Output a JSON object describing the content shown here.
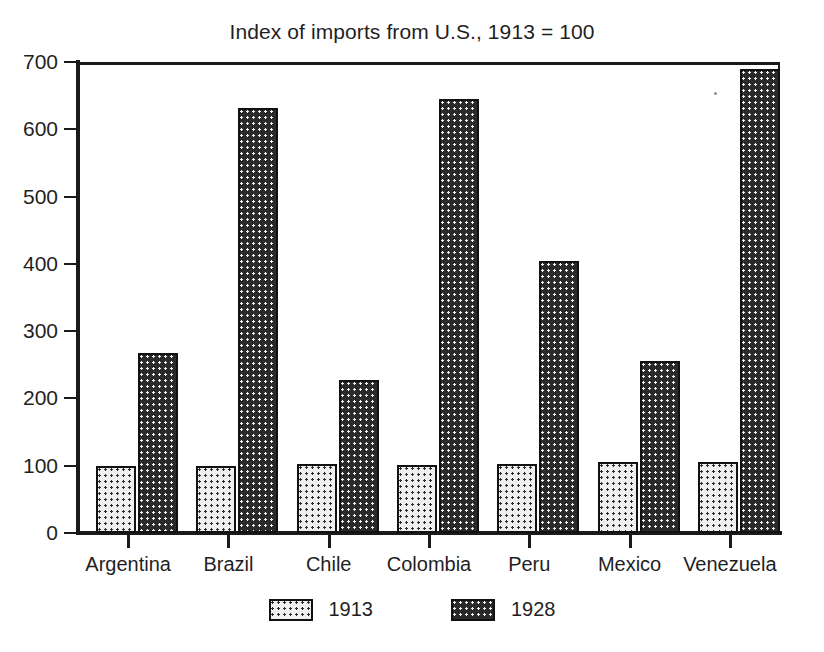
{
  "chart_data": {
    "type": "bar",
    "title": "Index of imports from U.S., 1913 = 100",
    "xlabel": "",
    "ylabel": "",
    "categories": [
      "Argentina",
      "Brazil",
      "Chile",
      "Colombia",
      "Peru",
      "Mexico",
      "Venezuela"
    ],
    "series": [
      {
        "name": "1913",
        "values": [
          99,
          99,
          102,
          101,
          102,
          105,
          105
        ]
      },
      {
        "name": "1928",
        "values": [
          268,
          631,
          227,
          645,
          404,
          255,
          690
        ]
      }
    ],
    "ylim": [
      0,
      700
    ],
    "yticks": [
      0,
      100,
      200,
      300,
      400,
      500,
      600,
      700
    ],
    "ytick_labels": [
      "0",
      "100",
      "200",
      "300",
      "400",
      "500",
      "600",
      "700"
    ],
    "grid": false,
    "legend_position": "bottom",
    "legend_entries": [
      "1913",
      "1928"
    ],
    "colors": {
      "series_1913_fill": "#efefef",
      "series_1913_dot": "#2b2b2b",
      "series_1928_fill": "#2a2a2a",
      "series_1928_dot": "#f2f2f2",
      "axis": "#1a1a1a",
      "text": "#1f1f1f",
      "background": "#ffffff"
    }
  }
}
